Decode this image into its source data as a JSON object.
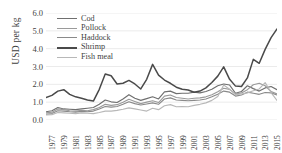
{
  "chart_data": {
    "type": "line",
    "title": "",
    "xlabel": "",
    "ylabel": "USD per kg",
    "ylim": [
      0.0,
      6.0
    ],
    "yticks": [
      "0.0",
      "1.0",
      "2.0",
      "3.0",
      "4.0",
      "5.0",
      "6.0"
    ],
    "grid": true,
    "legend_position": "top-left",
    "x": [
      1977,
      1978,
      1979,
      1980,
      1981,
      1982,
      1983,
      1984,
      1985,
      1986,
      1987,
      1988,
      1989,
      1990,
      1991,
      1992,
      1993,
      1994,
      1995,
      1996,
      1997,
      1998,
      1999,
      2000,
      2001,
      2002,
      2003,
      2004,
      2005,
      2006,
      2007,
      2008,
      2009,
      2010,
      2011,
      2012,
      2013,
      2014,
      2015,
      2016
    ],
    "xtick_labels": [
      "1977",
      "1979",
      "1981",
      "1983",
      "1985",
      "1987",
      "1989",
      "1991",
      "1993",
      "1995",
      "1997",
      "1999",
      "2001",
      "2003",
      "2005",
      "2007",
      "2009",
      "2011",
      "2013",
      "2015"
    ],
    "series": [
      {
        "name": "Cod",
        "color": "#6f6f6f",
        "values": [
          0.46,
          0.52,
          0.7,
          0.62,
          0.6,
          0.58,
          0.62,
          0.66,
          0.7,
          0.88,
          1.12,
          1.02,
          0.98,
          1.18,
          1.42,
          1.22,
          1.1,
          1.2,
          1.3,
          1.18,
          1.58,
          1.62,
          1.48,
          1.5,
          1.5,
          1.56,
          1.52,
          1.6,
          1.72,
          1.92,
          2.02,
          1.96,
          1.5,
          1.6,
          1.92,
          1.76,
          1.62,
          1.8,
          1.88,
          1.7
        ]
      },
      {
        "name": "Pollock",
        "color": "#9a9a9a",
        "values": [
          0.4,
          0.44,
          0.62,
          0.58,
          0.52,
          0.5,
          0.54,
          0.52,
          0.58,
          0.7,
          0.88,
          0.82,
          0.86,
          1.0,
          1.16,
          1.04,
          0.92,
          1.0,
          1.08,
          0.98,
          1.34,
          1.4,
          1.26,
          1.22,
          1.18,
          1.22,
          1.24,
          1.3,
          1.42,
          1.58,
          1.78,
          1.72,
          1.46,
          1.52,
          1.7,
          1.98,
          2.06,
          1.92,
          1.6,
          1.46
        ]
      },
      {
        "name": "Haddock",
        "color": "#8a8a8a",
        "values": [
          0.32,
          0.36,
          0.52,
          0.5,
          0.46,
          0.44,
          0.48,
          0.46,
          0.5,
          0.62,
          0.76,
          0.72,
          0.76,
          0.88,
          1.02,
          0.92,
          0.84,
          0.9,
          0.96,
          0.88,
          1.18,
          1.24,
          1.12,
          1.1,
          1.08,
          1.1,
          1.12,
          1.18,
          1.3,
          1.44,
          1.62,
          1.56,
          1.34,
          1.4,
          1.56,
          1.5,
          1.44,
          1.54,
          1.52,
          1.4
        ]
      },
      {
        "name": "Shrimp",
        "color": "#4a4a4a",
        "values": [
          1.26,
          1.38,
          1.62,
          1.7,
          1.44,
          1.3,
          1.22,
          1.12,
          1.06,
          1.72,
          2.58,
          2.48,
          2.02,
          2.06,
          2.22,
          2.02,
          1.74,
          2.28,
          3.12,
          2.52,
          2.24,
          2.06,
          1.84,
          1.72,
          1.68,
          1.56,
          1.62,
          1.8,
          2.1,
          2.46,
          2.98,
          2.28,
          1.9,
          1.88,
          2.36,
          3.4,
          3.18,
          3.96,
          4.62,
          5.1
        ]
      },
      {
        "name": "Fish meal",
        "color": "#b8b8b8",
        "values": [
          0.28,
          0.3,
          0.42,
          0.4,
          0.38,
          0.36,
          0.4,
          0.38,
          0.36,
          0.42,
          0.5,
          0.5,
          0.54,
          0.6,
          0.68,
          0.62,
          0.56,
          0.5,
          0.66,
          0.58,
          0.8,
          0.86,
          0.74,
          0.76,
          0.74,
          0.82,
          0.88,
          0.96,
          1.1,
          1.32,
          1.96,
          1.72,
          1.42,
          1.46,
          1.52,
          1.64,
          1.74,
          2.1,
          1.54,
          1.1
        ]
      }
    ],
    "tail": {
      "note": "shrimp peak then decline",
      "shrimp_peak_value": 5.72,
      "shrimp_peak_year": 2013,
      "shrimp_end_value": 4.52
    }
  },
  "legend": {
    "items": [
      {
        "label": "Cod"
      },
      {
        "label": "Pollock"
      },
      {
        "label": "Haddock"
      },
      {
        "label": "Shrimp"
      },
      {
        "label": "Fish meal"
      }
    ]
  }
}
